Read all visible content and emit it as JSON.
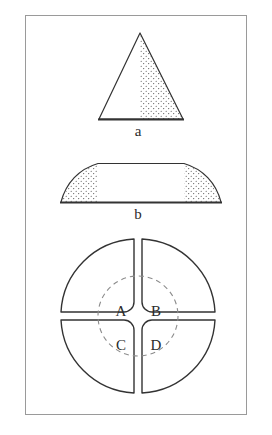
{
  "figure": {
    "title": "",
    "background_color": "#ffffff",
    "frame": {
      "name": "figure-border",
      "stroke_color": "#9a9a9a",
      "x": 25,
      "y": 15,
      "width": 222,
      "height": 400
    },
    "stroke_color": "#333333",
    "dash_color": "#8c8c8c",
    "stipple_color": "#4a4a4a",
    "panels": [
      {
        "id": "a",
        "label": "a",
        "shape": "triangle",
        "description": "Isosceles triangle with stippled (dotted) fill over its right half",
        "apex": [
          140,
          33
        ],
        "base_left": [
          99,
          119
        ],
        "base_right": [
          183,
          119
        ],
        "stipple_region": "right-half"
      },
      {
        "id": "b",
        "label": "b",
        "shape": "trapezoid",
        "description": "Wide trapezoid with curved flanks; stippled (dotted) fill in both end regions",
        "base_left": [
          61,
          202
        ],
        "base_right": [
          221,
          202
        ],
        "top_left": [
          98,
          163
        ],
        "top_right": [
          184,
          163
        ],
        "stipple_region": "both-ends"
      },
      {
        "id": "c",
        "label": "",
        "shape": "quartered-circle",
        "description": "Circle divided into four quadrant sectors by a cross-shaped gap, with a dashed inner circle overlaid",
        "center": [
          138,
          316
        ],
        "outer_radius": 77,
        "inner_dashed_radius": 40,
        "gap_half_width": 4,
        "corner_radius": 10,
        "quadrants": [
          {
            "name": "quadrant-a",
            "letter": "A",
            "position": "top-left",
            "letter_xy": [
              121,
              310
            ]
          },
          {
            "name": "quadrant-b",
            "letter": "B",
            "position": "top-right",
            "letter_xy": [
              156,
              310
            ]
          },
          {
            "name": "quadrant-c",
            "letter": "C",
            "position": "bottom-left",
            "letter_xy": [
              121,
              345
            ]
          },
          {
            "name": "quadrant-d",
            "letter": "D",
            "position": "bottom-right",
            "letter_xy": [
              156,
              345
            ]
          }
        ]
      }
    ]
  }
}
